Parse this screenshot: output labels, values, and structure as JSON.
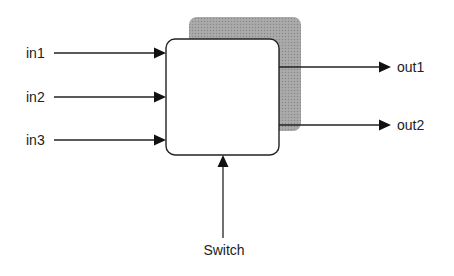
{
  "diagram": {
    "block": {
      "label": ""
    },
    "inputs": [
      {
        "label": "in1"
      },
      {
        "label": "in2"
      },
      {
        "label": "in3"
      }
    ],
    "outputs": [
      {
        "label": "out1"
      },
      {
        "label": "out2"
      }
    ],
    "control": {
      "label": "Switch"
    },
    "colors": {
      "stroke": "#222222",
      "shadow": "#9a9a9a",
      "block_fill": "#ffffff"
    }
  }
}
